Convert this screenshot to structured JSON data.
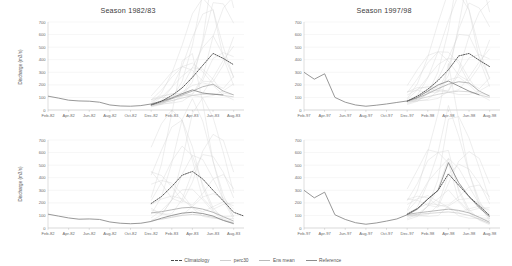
{
  "figure": {
    "ylabel": "Discharge (m3/s)",
    "yticks": [
      0,
      100,
      200,
      300,
      400,
      500,
      600,
      700
    ],
    "ylim": [
      0,
      700
    ]
  },
  "legend": {
    "position": "bottom-center",
    "items": [
      {
        "label": "Climatology",
        "color": "#4a4a4a",
        "style": "dashed"
      },
      {
        "label": "perc30",
        "color": "#cfcfcf",
        "style": "solid"
      },
      {
        "label": "Ens mean",
        "color": "#b9b9b9",
        "style": "solid"
      },
      {
        "label": "Reference",
        "color": "#8c8c8c",
        "style": "solid"
      }
    ]
  },
  "chart_data": [
    {
      "id": "top-left",
      "type": "line",
      "title": "Season 1982/83",
      "xlabel": "",
      "ylabel": "Discharge (m3/s)",
      "ylim": [
        0,
        700
      ],
      "grid": true,
      "legend": "bottom",
      "categories": [
        "Feb-82",
        "Apr-82",
        "Jun-82",
        "Aug-82",
        "Oct-82",
        "Dec-82",
        "Feb-83",
        "Apr-83",
        "Jun-83",
        "Aug-83"
      ],
      "x": [
        0,
        1,
        2,
        3,
        4,
        5,
        6,
        7,
        8,
        9,
        10,
        11,
        12,
        13,
        14,
        15,
        16,
        17,
        18,
        19
      ],
      "series": [
        {
          "name": "Reference",
          "values": [
            110,
            95,
            78,
            72,
            70,
            62,
            40,
            32,
            30,
            35,
            48,
            70,
            95,
            130,
            160,
            135,
            125,
            120,
            null,
            null
          ]
        },
        {
          "name": "Climatology",
          "values": [
            null,
            null,
            null,
            null,
            null,
            null,
            null,
            null,
            null,
            null,
            40,
            70,
            115,
            175,
            260,
            355,
            450,
            410,
            360,
            null
          ]
        },
        {
          "name": "Ens mean",
          "values": [
            null,
            null,
            null,
            null,
            null,
            null,
            null,
            null,
            null,
            null,
            40,
            62,
            90,
            120,
            150,
            185,
            205,
            150,
            120,
            null
          ]
        },
        {
          "name": "perc30",
          "values": [
            null,
            null,
            null,
            null,
            null,
            null,
            null,
            null,
            null,
            null,
            38,
            55,
            75,
            95,
            115,
            125,
            130,
            115,
            105,
            null
          ]
        }
      ]
    },
    {
      "id": "top-right",
      "type": "line",
      "title": "Season 1997/98",
      "xlabel": "",
      "ylabel": "Discharge (m3/s)",
      "ylim": [
        0,
        700
      ],
      "grid": true,
      "legend": "bottom",
      "categories": [
        "Feb-97",
        "Apr-97",
        "Jun-97",
        "Aug-97",
        "Oct-97",
        "Dec-97",
        "Feb-98",
        "Apr-98",
        "Jun-98",
        "Aug-98"
      ],
      "x": [
        0,
        1,
        2,
        3,
        4,
        5,
        6,
        7,
        8,
        9,
        10,
        11,
        12,
        13,
        14,
        15,
        16,
        17,
        18,
        19
      ],
      "series": [
        {
          "name": "Reference",
          "values": [
            300,
            245,
            288,
            100,
            62,
            40,
            30,
            38,
            48,
            60,
            72,
            100,
            150,
            200,
            230,
            190,
            150,
            120,
            null,
            null
          ]
        },
        {
          "name": "Climatology",
          "values": [
            null,
            null,
            null,
            null,
            null,
            null,
            null,
            null,
            null,
            null,
            70,
            110,
            165,
            235,
            320,
            430,
            450,
            395,
            345,
            null
          ]
        },
        {
          "name": "Ens mean",
          "values": [
            null,
            null,
            null,
            null,
            null,
            null,
            null,
            null,
            null,
            null,
            70,
            95,
            130,
            170,
            205,
            225,
            215,
            150,
            110,
            null
          ]
        },
        {
          "name": "perc30",
          "values": [
            null,
            null,
            null,
            null,
            null,
            null,
            null,
            null,
            null,
            null,
            68,
            85,
            105,
            125,
            140,
            150,
            145,
            120,
            100,
            null
          ]
        }
      ]
    },
    {
      "id": "bottom-left",
      "type": "line",
      "title": "",
      "xlabel": "",
      "ylabel": "Discharge (m3/s)",
      "ylim": [
        0,
        700
      ],
      "grid": true,
      "legend": "bottom",
      "categories": [
        "Feb-82",
        "Apr-82",
        "Jun-82",
        "Aug-82",
        "Oct-82",
        "Dec-82",
        "Feb-83",
        "Apr-83",
        "Jun-83",
        "Aug-83"
      ],
      "x": [
        0,
        1,
        2,
        3,
        4,
        5,
        6,
        7,
        8,
        9,
        10,
        11,
        12,
        13,
        14,
        15,
        16,
        17,
        18,
        19
      ],
      "series": [
        {
          "name": "Reference",
          "values": [
            110,
            95,
            80,
            70,
            72,
            68,
            48,
            38,
            34,
            38,
            52,
            78,
            100,
            118,
            125,
            115,
            95,
            60,
            35,
            null
          ]
        },
        {
          "name": "Climatology",
          "values": [
            null,
            null,
            null,
            null,
            null,
            null,
            null,
            null,
            null,
            null,
            195,
            250,
            330,
            420,
            450,
            390,
            300,
            215,
            125,
            95
          ]
        },
        {
          "name": "Ens mean",
          "values": [
            null,
            null,
            null,
            null,
            null,
            null,
            null,
            null,
            null,
            null,
            120,
            130,
            145,
            160,
            165,
            150,
            125,
            90,
            55,
            null
          ]
        },
        {
          "name": "perc30",
          "values": [
            null,
            null,
            null,
            null,
            null,
            null,
            null,
            null,
            null,
            null,
            60,
            70,
            85,
            100,
            108,
            100,
            85,
            62,
            40,
            null
          ]
        }
      ]
    },
    {
      "id": "bottom-right",
      "type": "line",
      "title": "",
      "xlabel": "",
      "ylabel": "Discharge (m3/s)",
      "ylim": [
        0,
        700
      ],
      "grid": true,
      "legend": "bottom",
      "categories": [
        "Feb-97",
        "Apr-97",
        "Jun-97",
        "Aug-97",
        "Oct-97",
        "Dec-97",
        "Feb-98",
        "Apr-98",
        "Jun-98",
        "Aug-98"
      ],
      "x": [
        0,
        1,
        2,
        3,
        4,
        5,
        6,
        7,
        8,
        9,
        10,
        11,
        12,
        13,
        14,
        15,
        16,
        17,
        18,
        19
      ],
      "series": [
        {
          "name": "Reference",
          "values": [
            300,
            240,
            285,
            105,
            68,
            42,
            30,
            40,
            55,
            72,
            105,
            150,
            230,
            300,
            520,
            360,
            250,
            160,
            90,
            null
          ]
        },
        {
          "name": "Climatology",
          "values": [
            null,
            null,
            null,
            null,
            null,
            null,
            null,
            null,
            null,
            null,
            110,
            155,
            230,
            300,
            430,
            340,
            250,
            175,
            100,
            null
          ]
        },
        {
          "name": "Ens mean",
          "values": [
            null,
            null,
            null,
            null,
            null,
            null,
            null,
            null,
            null,
            null,
            108,
            120,
            130,
            140,
            150,
            140,
            120,
            85,
            45,
            null
          ]
        },
        {
          "name": "perc30",
          "values": [
            null,
            null,
            null,
            null,
            null,
            null,
            null,
            null,
            null,
            null,
            100,
            108,
            115,
            122,
            128,
            118,
            100,
            70,
            35,
            null
          ]
        }
      ]
    }
  ]
}
